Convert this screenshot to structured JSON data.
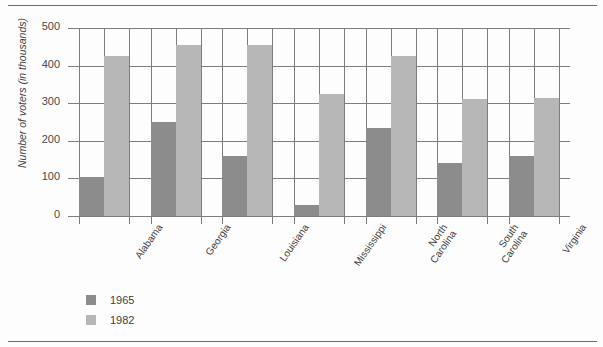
{
  "chart_data": {
    "type": "bar",
    "title": "",
    "subtitle": "",
    "xlabel": "",
    "ylabel": "Number of voters (in thousands)",
    "categories": [
      "Alabama",
      "Georgia",
      "Louisiana",
      "Mississippi",
      "North Carolina",
      "South Carolina",
      "Virginia"
    ],
    "category_lines": [
      [
        "Alabama"
      ],
      [
        "Georgia"
      ],
      [
        "Louisiana"
      ],
      [
        "Mississippi"
      ],
      [
        "North",
        "Carolina"
      ],
      [
        "South",
        "Carolina"
      ],
      [
        "Virginia"
      ]
    ],
    "series": [
      {
        "name": "1965",
        "color": "#8c8c8c",
        "values": [
          105,
          250,
          160,
          28,
          235,
          140,
          160
        ]
      },
      {
        "name": "1982",
        "color": "#b7b7b7",
        "values": [
          425,
          455,
          455,
          325,
          425,
          310,
          315
        ]
      }
    ],
    "ylim": [
      0,
      500
    ],
    "yticks": [
      0,
      100,
      200,
      300,
      400,
      500
    ],
    "ytick_labels": [
      "0",
      "100",
      "200",
      "300",
      "400",
      "500"
    ],
    "grid": "both",
    "legend_position": "below-left",
    "legend": [
      {
        "label": "1965",
        "color": "#8c8c8c"
      },
      {
        "label": "1982",
        "color": "#b7b7b7"
      }
    ]
  }
}
